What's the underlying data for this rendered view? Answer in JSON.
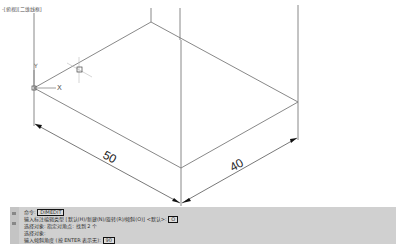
{
  "viewport": {
    "label": "-[俯视][二维线框]",
    "ucs": {
      "x_label": "X",
      "y_label": "Y"
    },
    "dimensions": [
      {
        "value": "50",
        "angle_deg": 28
      },
      {
        "value": "40",
        "angle_deg": -29
      }
    ],
    "colors": {
      "lines": "#7a7a7a",
      "dim_lines": "#555555",
      "background": "#ffffff"
    }
  },
  "command_line": {
    "lines": [
      {
        "prefix": "命令: ",
        "input": "DIMEDIT"
      },
      {
        "prefix": "输入标注编辑类型 [默认(H)/新建(N)/旋转(R)/倾斜(O)] <默认>: ",
        "input": "O"
      },
      {
        "prefix": "选择对象: 指定对角点: 找到 2 个",
        "input": null
      },
      {
        "prefix": "选择对象:",
        "input": null
      },
      {
        "prefix": "输入倾斜角度 (按 ENTER 表示无): ",
        "input": "90"
      }
    ],
    "colors": {
      "background": "#d0d0d0",
      "text": "#333333"
    }
  }
}
